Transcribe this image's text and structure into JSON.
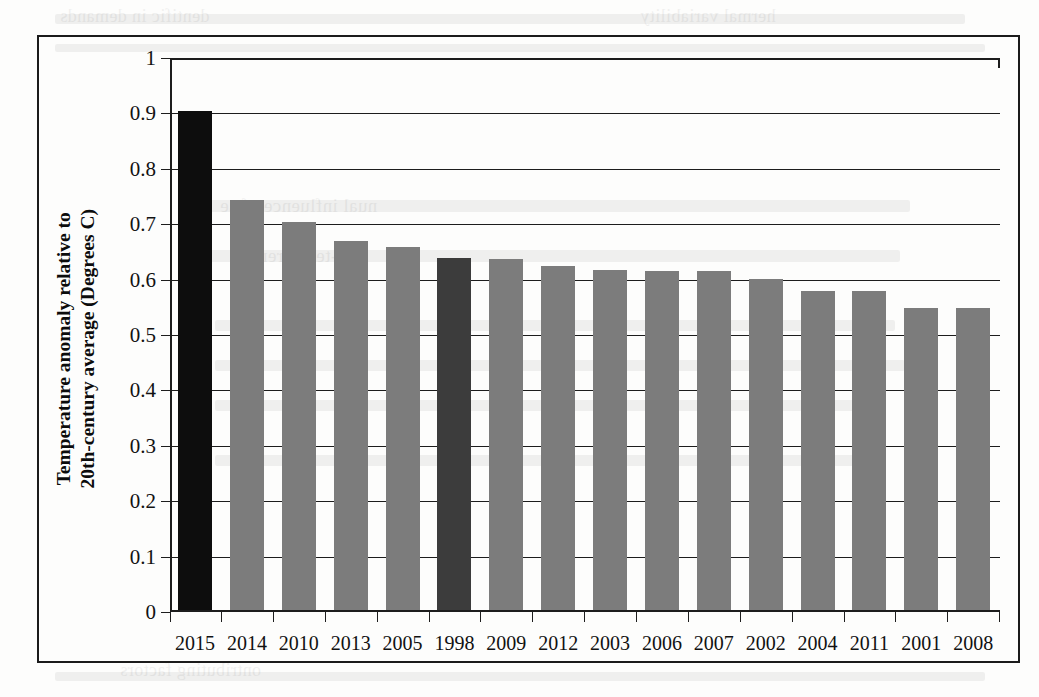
{
  "page": {
    "kind": "scanned-book-page-figure",
    "background_color": "#fdfdfc",
    "frame_color": "#1b1b1b"
  },
  "chart_data": {
    "type": "bar",
    "title": "",
    "xlabel": "",
    "ylabel": "Temperature anomaly relative to 20th-century average (Degrees C)",
    "ylabel_line1": "Temperature anomaly relative to",
    "ylabel_line2": "20th-century average (Degrees C)",
    "ylim": [
      0,
      1
    ],
    "ytick_step": 0.1,
    "ytick_labels": [
      "1",
      "0.9",
      "0.8",
      "0.7",
      "0.6",
      "0.5",
      "0.4",
      "0.3",
      "0.2",
      "0.1",
      "0"
    ],
    "ytick_values": [
      1,
      0.9,
      0.8,
      0.7,
      0.6,
      0.5,
      0.4,
      0.3,
      0.2,
      0.1,
      0
    ],
    "grid": true,
    "legend": "none",
    "categories": [
      "2015",
      "2014",
      "2010",
      "2013",
      "2005",
      "1998",
      "2009",
      "2012",
      "2003",
      "2006",
      "2007",
      "2002",
      "2004",
      "2011",
      "2001",
      "2008"
    ],
    "values": [
      0.9,
      0.74,
      0.7,
      0.666,
      0.656,
      0.635,
      0.633,
      0.621,
      0.613,
      0.612,
      0.612,
      0.598,
      0.575,
      0.575,
      0.546,
      0.545
    ],
    "bar_colors": [
      "#0d0d0d",
      "#7c7c7c",
      "#7c7c7c",
      "#7c7c7c",
      "#7c7c7c",
      "#3c3c3c",
      "#7c7c7c",
      "#7c7c7c",
      "#7c7c7c",
      "#7c7c7c",
      "#7c7c7c",
      "#7c7c7c",
      "#7c7c7c",
      "#7c7c7c",
      "#7c7c7c",
      "#7c7c7c"
    ],
    "highlight_notes": {
      "2015": "black bar (record warmest year)",
      "1998": "dark gray bar (previous benchmark year)"
    },
    "default_bar_color": "#7c7c7c"
  },
  "ghost_text": {
    "note": "faint bleed-through from reverse of scanned page, illegible",
    "lines": [
      "dentific in demands",
      "hermal variability",
      "nual influence of se",
      "ong-term trends"
    ]
  }
}
